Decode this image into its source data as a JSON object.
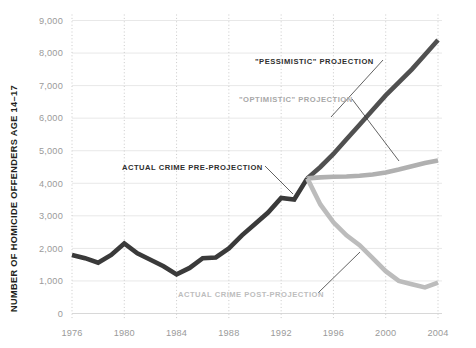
{
  "chart_data": {
    "type": "line",
    "title": "",
    "xlabel": "",
    "ylabel": "NUMBER OF HOMICIDE OFFENDERS AGE 14–17",
    "xlim": [
      1976,
      2004
    ],
    "ylim": [
      0,
      9000
    ],
    "grid": "horizontal-solid-and-vertical-dotted",
    "legend_position": "inline-annotations",
    "x_ticks": [
      "1976",
      "1980",
      "1984",
      "1988",
      "1992",
      "1996",
      "2000",
      "2004"
    ],
    "x_tick_values": [
      1976,
      1980,
      1984,
      1988,
      1992,
      1996,
      2000,
      2004
    ],
    "y_ticks": [
      "0",
      "1,000",
      "2,000",
      "3,000",
      "4,000",
      "5,000",
      "6,000",
      "7,000",
      "8,000",
      "9,000"
    ],
    "y_tick_values": [
      0,
      1000,
      2000,
      3000,
      4000,
      5000,
      6000,
      7000,
      8000,
      9000
    ],
    "series": [
      {
        "name": "ACTUAL CRIME PRE-PROJECTION",
        "color": "#3a3a3a",
        "width": 4.6,
        "x": [
          1976,
          1977,
          1978,
          1979,
          1980,
          1981,
          1982,
          1983,
          1984,
          1985,
          1986,
          1987,
          1988,
          1989,
          1990,
          1991,
          1992,
          1993,
          1994
        ],
        "values": [
          1800,
          1700,
          1560,
          1800,
          2150,
          1850,
          1650,
          1450,
          1200,
          1400,
          1700,
          1720,
          2000,
          2400,
          2750,
          3100,
          3550,
          3500,
          4150
        ]
      },
      {
        "name": "\"PESSIMISTIC\" PROJECTION",
        "color": "#505050",
        "width": 4.6,
        "x": [
          1994,
          1995,
          1996,
          1997,
          1998,
          1999,
          2000,
          2001,
          2002,
          2003,
          2004
        ],
        "values": [
          4150,
          4500,
          4900,
          5350,
          5800,
          6250,
          6700,
          7100,
          7500,
          7950,
          8400
        ]
      },
      {
        "name": "\"OPTIMISTIC\" PROJECTION",
        "color": "#b0b0b0",
        "width": 4.6,
        "x": [
          1994,
          1995,
          1996,
          1997,
          1998,
          1999,
          2000,
          2001,
          2002,
          2003,
          2004
        ],
        "values": [
          4150,
          4180,
          4200,
          4210,
          4230,
          4270,
          4330,
          4420,
          4520,
          4620,
          4700
        ]
      },
      {
        "name": "ACTUAL CRIME POST-PROJECTION",
        "color": "#bcbcbc",
        "width": 4.6,
        "x": [
          1994,
          1995,
          1996,
          1997,
          1998,
          1999,
          2000,
          2001,
          2002,
          2003,
          2004
        ],
        "values": [
          4150,
          3350,
          2800,
          2400,
          2100,
          1700,
          1300,
          1000,
          900,
          800,
          950
        ]
      }
    ],
    "annotations": [
      {
        "text": "\"PESSIMISTIC\" PROJECTION",
        "color": "#2f2f2f",
        "label_x": 255,
        "label_y": 64,
        "leader_from_x": 383,
        "leader_from_y": 60,
        "leader_to_x": 331,
        "leader_to_y": 117
      },
      {
        "text": "\"OPTIMISTIC\" PROJECTION",
        "color": "#a8a8a8",
        "label_x": 239,
        "label_y": 102,
        "leader_from_x": 352,
        "leader_from_y": 99,
        "leader_to_x": 399,
        "leader_to_y": 161
      },
      {
        "text": "ACTUAL CRIME PRE-PROJECTION",
        "color": "#2f2f2f",
        "label_x": 122,
        "label_y": 170,
        "leader_from_x": 265,
        "leader_from_y": 166,
        "leader_to_x": 293,
        "leader_to_y": 194
      },
      {
        "text": "ACTUAL CRIME POST-PROJECTION",
        "color": "#bdbdbd",
        "label_x": 178,
        "label_y": 297,
        "leader_from_x": 318,
        "leader_from_y": 293,
        "leader_to_x": 360,
        "leader_to_y": 252
      }
    ]
  }
}
